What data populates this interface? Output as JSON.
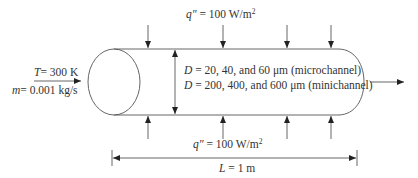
{
  "diagram": {
    "type": "channel-flow-schematic",
    "inlet": {
      "temperature_var": "T",
      "temperature_value": "= 300 K",
      "massflow_var": "m",
      "massflow_value": "= 0.001 kg/s"
    },
    "heat_flux_top": {
      "var": "q″",
      "value": " = 100 W/m",
      "exponent": "2"
    },
    "heat_flux_bottom": {
      "var": "q″",
      "value": " = 100 W/m",
      "exponent": "2"
    },
    "diameters": {
      "micro_var": "D",
      "micro_value": " = 20, 40, and 60 μm (microchannel)",
      "mini_var": "D",
      "mini_value": " = 200, 400, and 600 μm (minichannel)"
    },
    "length": {
      "var": "L",
      "value": " = 1 m"
    },
    "colors": {
      "line": "#555555",
      "text": "#333333",
      "background": "#ffffff"
    }
  }
}
